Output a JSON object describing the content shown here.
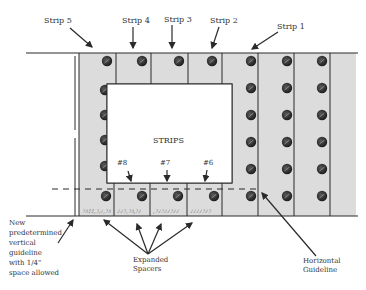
{
  "diagram": {
    "title": "STRIPS",
    "colors": {
      "strip_fill": "#dcdcdc",
      "line": "#2a2a2a",
      "screw": "#2b2b2b",
      "background": "#ffffff"
    },
    "strip_labels": [
      "Strip 5",
      "Strip 4",
      "Strip 3",
      "Strip 2",
      "Strip 1"
    ],
    "bottom_labels": [
      "#8",
      "#7",
      "#6"
    ],
    "callouts": {
      "vertical_guideline": [
        "New",
        "predetermined",
        "vertical",
        "guideline",
        "with 1/4\"",
        "space allowed"
      ],
      "spacers": [
        "Expanded",
        "Spacers"
      ],
      "horizontal_guideline": [
        "Horizontal",
        "Guideline"
      ]
    }
  }
}
